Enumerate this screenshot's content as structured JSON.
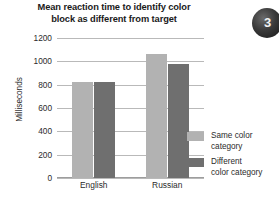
{
  "badge": {
    "number": "3"
  },
  "legend": {
    "position": "right",
    "items": [
      {
        "label_line1": "Same color",
        "label_line2": "category",
        "color": "#b2b2b2"
      },
      {
        "label_line1": "Different",
        "label_line2": "color category",
        "color": "#6f6f6f"
      }
    ]
  },
  "chart_data": {
    "type": "bar",
    "title_line1": "Mean reaction time to identify color",
    "title_line2": "block as different from target",
    "title": "Mean reaction time to identify color block as different from target",
    "xlabel": "",
    "ylabel": "Milliseconds",
    "categories": [
      "English",
      "Russian"
    ],
    "series": [
      {
        "name": "Same color category",
        "values": [
          820,
          1060
        ],
        "color": "#b2b2b2"
      },
      {
        "name": "Different color category",
        "values": [
          820,
          975
        ],
        "color": "#6f6f6f"
      }
    ],
    "ylim": [
      0,
      1200
    ],
    "yticks": [
      0,
      200,
      400,
      600,
      800,
      1000,
      1200
    ],
    "ytick_labels": [
      "0",
      "200",
      "400",
      "600",
      "800",
      "1000",
      "1200"
    ],
    "grid": true
  }
}
